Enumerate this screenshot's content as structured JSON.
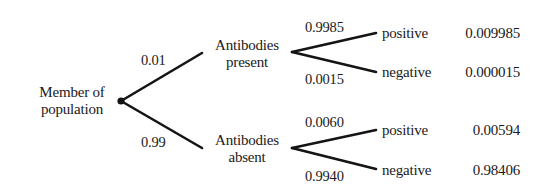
{
  "diagram": {
    "type": "probability-tree",
    "root": {
      "label_line1": "Member of",
      "label_line2": "population"
    },
    "level1": [
      {
        "id": "present",
        "label_line1": "Antibodies",
        "label_line2": "present",
        "probability": "0.01",
        "children": [
          {
            "label": "positive",
            "probability": "0.9985",
            "joint": "0.009985"
          },
          {
            "label": "negative",
            "probability": "0.0015",
            "joint": "0.000015"
          }
        ]
      },
      {
        "id": "absent",
        "label_line1": "Antibodies",
        "label_line2": "absent",
        "probability": "0.99",
        "children": [
          {
            "label": "positive",
            "probability": "0.0060",
            "joint": "0.00594"
          },
          {
            "label": "negative",
            "probability": "0.9940",
            "joint": "0.98406"
          }
        ]
      }
    ]
  }
}
